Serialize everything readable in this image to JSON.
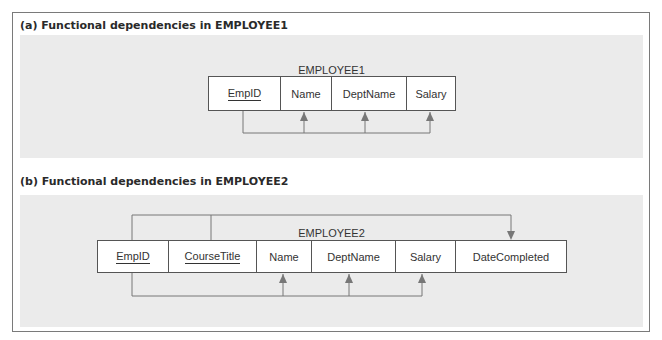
{
  "colors": {
    "panel_bg": "#ebebeb",
    "border": "#7a7a7a",
    "arrow": "#777777",
    "cell_bg": "#ffffff"
  },
  "panel_a": {
    "heading": "(a) Functional dependencies in EMPLOYEE1",
    "relation_name": "EMPLOYEE1",
    "attributes": [
      {
        "name": "EmpID",
        "primary_key": true
      },
      {
        "name": "Name",
        "primary_key": false
      },
      {
        "name": "DeptName",
        "primary_key": false
      },
      {
        "name": "Salary",
        "primary_key": false
      }
    ],
    "dependencies": [
      {
        "determinant": [
          "EmpID"
        ],
        "dependents": [
          "Name",
          "DeptName",
          "Salary"
        ]
      }
    ]
  },
  "panel_b": {
    "heading": "(b) Functional dependencies in EMPLOYEE2",
    "relation_name": "EMPLOYEE2",
    "attributes": [
      {
        "name": "EmpID",
        "primary_key": true
      },
      {
        "name": "CourseTitle",
        "primary_key": true
      },
      {
        "name": "Name",
        "primary_key": false
      },
      {
        "name": "DeptName",
        "primary_key": false
      },
      {
        "name": "Salary",
        "primary_key": false
      },
      {
        "name": "DateCompleted",
        "primary_key": false
      }
    ],
    "dependencies": [
      {
        "determinant": [
          "EmpID",
          "CourseTitle"
        ],
        "dependents": [
          "DateCompleted"
        ]
      },
      {
        "determinant": [
          "EmpID"
        ],
        "dependents": [
          "Name",
          "DeptName",
          "Salary"
        ]
      }
    ]
  }
}
